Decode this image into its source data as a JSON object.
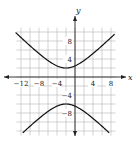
{
  "chart_data": {
    "type": "line",
    "title": "",
    "xlabel": "x",
    "ylabel": "y",
    "xlim": [
      -13,
      9
    ],
    "ylim": [
      -14,
      12
    ],
    "grid": true,
    "grid_step": 2,
    "x_ticks": [
      -12,
      -8,
      -4,
      4,
      8
    ],
    "y_ticks": [
      8,
      4,
      -4,
      -8
    ],
    "x_tick_labels": [
      "−12",
      "−8",
      "−4",
      "4",
      "8"
    ],
    "y_tick_labels": [
      "8",
      "4",
      "−4",
      "−8"
    ],
    "series": [
      {
        "name": "hyperbola",
        "equation": "(y+2)^2/16 - (x+2)^2/16 = 1",
        "center": [
          -2,
          -2
        ],
        "vertices": [
          [
            -2,
            2
          ],
          [
            -2,
            -6
          ]
        ],
        "branches": [
          "upper",
          "lower"
        ]
      }
    ],
    "legend": null
  },
  "labels": {
    "x_axis": "x",
    "y_axis": "y",
    "ticks_x": [
      "−12",
      "−8",
      "−4",
      "4",
      "8"
    ],
    "ticks_y": [
      "8",
      "4",
      "−4",
      "−8"
    ]
  }
}
